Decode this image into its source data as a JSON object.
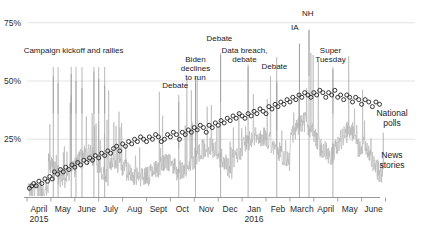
{
  "chart_data": {
    "type": "line",
    "title": "",
    "subtitle": "",
    "xlabel": "",
    "ylabel": "",
    "ylim": [
      0,
      80
    ],
    "xlim": [
      0,
      15
    ],
    "grid": true,
    "legend_position": "right-inline",
    "y_ticks": [
      {
        "value": 25,
        "label": "25%"
      },
      {
        "value": 50,
        "label": "50%"
      },
      {
        "value": 75,
        "label": "75%"
      }
    ],
    "x_tick_labels": [
      {
        "index": 0,
        "label": "April",
        "sublabel": "2015"
      },
      {
        "index": 1,
        "label": "May",
        "sublabel": ""
      },
      {
        "index": 2,
        "label": "June",
        "sublabel": ""
      },
      {
        "index": 3,
        "label": "July",
        "sublabel": ""
      },
      {
        "index": 4,
        "label": "Aug",
        "sublabel": ""
      },
      {
        "index": 5,
        "label": "Sept",
        "sublabel": ""
      },
      {
        "index": 6,
        "label": "Oct",
        "sublabel": ""
      },
      {
        "index": 7,
        "label": "Nov",
        "sublabel": ""
      },
      {
        "index": 8,
        "label": "Dec",
        "sublabel": ""
      },
      {
        "index": 9,
        "label": "Jan",
        "sublabel": "2016"
      },
      {
        "index": 10,
        "label": "Feb",
        "sublabel": ""
      },
      {
        "index": 11,
        "label": "March",
        "sublabel": ""
      },
      {
        "index": 12,
        "label": "April",
        "sublabel": ""
      },
      {
        "index": 13,
        "label": "May",
        "sublabel": ""
      },
      {
        "index": 14,
        "label": "June",
        "sublabel": ""
      }
    ],
    "series": [
      {
        "name": "National polls",
        "marker": "open-circle",
        "color": "#2a2a2a",
        "points": [
          [
            0.1,
            4
          ],
          [
            0.2,
            5
          ],
          [
            0.28,
            6
          ],
          [
            0.38,
            5
          ],
          [
            0.5,
            7
          ],
          [
            0.62,
            6
          ],
          [
            0.75,
            8
          ],
          [
            0.86,
            7
          ],
          [
            0.95,
            9
          ],
          [
            1.05,
            8
          ],
          [
            1.15,
            11
          ],
          [
            1.28,
            10
          ],
          [
            1.4,
            12
          ],
          [
            1.52,
            11
          ],
          [
            1.62,
            13
          ],
          [
            1.75,
            12
          ],
          [
            1.88,
            14
          ],
          [
            2.0,
            13
          ],
          [
            2.12,
            15
          ],
          [
            2.25,
            14
          ],
          [
            2.38,
            16
          ],
          [
            2.5,
            15
          ],
          [
            2.62,
            17
          ],
          [
            2.74,
            16
          ],
          [
            2.86,
            18
          ],
          [
            3.0,
            17
          ],
          [
            3.12,
            19
          ],
          [
            3.25,
            18
          ],
          [
            3.38,
            20
          ],
          [
            3.5,
            19
          ],
          [
            3.62,
            21
          ],
          [
            3.75,
            22
          ],
          [
            3.88,
            20
          ],
          [
            4.0,
            23
          ],
          [
            4.12,
            22
          ],
          [
            4.25,
            24
          ],
          [
            4.38,
            23
          ],
          [
            4.5,
            25
          ],
          [
            4.62,
            24
          ],
          [
            4.75,
            26
          ],
          [
            4.88,
            25
          ],
          [
            5.0,
            24
          ],
          [
            5.12,
            26
          ],
          [
            5.25,
            25
          ],
          [
            5.38,
            27
          ],
          [
            5.5,
            26
          ],
          [
            5.62,
            24
          ],
          [
            5.75,
            25
          ],
          [
            5.88,
            27
          ],
          [
            6.0,
            26
          ],
          [
            6.12,
            28
          ],
          [
            6.25,
            27
          ],
          [
            6.38,
            25
          ],
          [
            6.5,
            28
          ],
          [
            6.62,
            27
          ],
          [
            6.75,
            29
          ],
          [
            6.88,
            28
          ],
          [
            7.0,
            30
          ],
          [
            7.12,
            29
          ],
          [
            7.25,
            31
          ],
          [
            7.38,
            30
          ],
          [
            7.5,
            28
          ],
          [
            7.62,
            31
          ],
          [
            7.75,
            30
          ],
          [
            7.88,
            32
          ],
          [
            8.0,
            31
          ],
          [
            8.12,
            33
          ],
          [
            8.25,
            32
          ],
          [
            8.38,
            34
          ],
          [
            8.5,
            33
          ],
          [
            8.62,
            35
          ],
          [
            8.75,
            34
          ],
          [
            8.88,
            36
          ],
          [
            9.0,
            35
          ],
          [
            9.12,
            34
          ],
          [
            9.25,
            36
          ],
          [
            9.38,
            35
          ],
          [
            9.5,
            37
          ],
          [
            9.62,
            36
          ],
          [
            9.75,
            38
          ],
          [
            9.88,
            37
          ],
          [
            10.0,
            36
          ],
          [
            10.12,
            39
          ],
          [
            10.25,
            38
          ],
          [
            10.38,
            40
          ],
          [
            10.5,
            39
          ],
          [
            10.62,
            41
          ],
          [
            10.75,
            40
          ],
          [
            10.88,
            42
          ],
          [
            11.0,
            41
          ],
          [
            11.12,
            43
          ],
          [
            11.25,
            42
          ],
          [
            11.38,
            44
          ],
          [
            11.5,
            43
          ],
          [
            11.62,
            45
          ],
          [
            11.75,
            44
          ],
          [
            11.88,
            43
          ],
          [
            12.0,
            45
          ],
          [
            12.12,
            44
          ],
          [
            12.25,
            46
          ],
          [
            12.38,
            45
          ],
          [
            12.5,
            43
          ],
          [
            12.62,
            45
          ],
          [
            12.75,
            44
          ],
          [
            12.88,
            46
          ],
          [
            13.0,
            43
          ],
          [
            13.12,
            44
          ],
          [
            13.25,
            42
          ],
          [
            13.38,
            44
          ],
          [
            13.5,
            43
          ],
          [
            13.62,
            41
          ],
          [
            13.75,
            43
          ],
          [
            13.88,
            42
          ],
          [
            14.0,
            40
          ],
          [
            14.15,
            42
          ],
          [
            14.3,
            41
          ],
          [
            14.45,
            39
          ],
          [
            14.6,
            41
          ],
          [
            14.75,
            40
          ]
        ]
      },
      {
        "name": "News stories",
        "marker": "line",
        "color": "#b5b5b5",
        "description": "Daily spiky gray volume line of news stories, scaled to same percent axis"
      }
    ],
    "legend_entries": [
      {
        "label_line1": "National",
        "label_line2": "polls"
      },
      {
        "label_line1": "News",
        "label_line2": "stories"
      }
    ],
    "annotations": [
      {
        "text": "Campaign kickoff and rallies",
        "x_text": 1.95,
        "y_text": 62,
        "leaders": [
          1.1,
          1.3,
          1.85,
          2.05,
          2.3,
          2.8,
          3.0,
          3.25
        ]
      },
      {
        "text": "Debate",
        "x_text": 6.2,
        "y_text": 47,
        "leaders": [
          6.35
        ]
      },
      {
        "text": "Biden|declines|to run",
        "x_text": 7.05,
        "y_text": 58,
        "leaders": [
          7.05
        ]
      },
      {
        "text": "Debate",
        "x_text": 8.05,
        "y_text": 67,
        "leaders": [
          8.1
        ]
      },
      {
        "text": "Data breach,|debate",
        "x_text": 9.1,
        "y_text": 62,
        "leaders": [
          9.25
        ]
      },
      {
        "text": "Debate",
        "x_text": 10.35,
        "y_text": 55,
        "leaders": [
          10.45
        ]
      },
      {
        "text": "IA",
        "x_text": 11.2,
        "y_text": 72,
        "leaders": [
          11.4
        ]
      },
      {
        "text": "NH",
        "x_text": 11.75,
        "y_text": 78,
        "leaders": [
          11.8
        ]
      },
      {
        "text": "Super|Tuesday",
        "x_text": 12.7,
        "y_text": 62,
        "leaders": [
          12.8
        ]
      }
    ]
  },
  "colors": {
    "polls_marker": "#2a2a2a",
    "news_line": "#b5b5b5",
    "gridline": "#d9d9d9",
    "axis": "#8c8c8c",
    "text": "#1a1a1a",
    "background": "#ffffff"
  }
}
